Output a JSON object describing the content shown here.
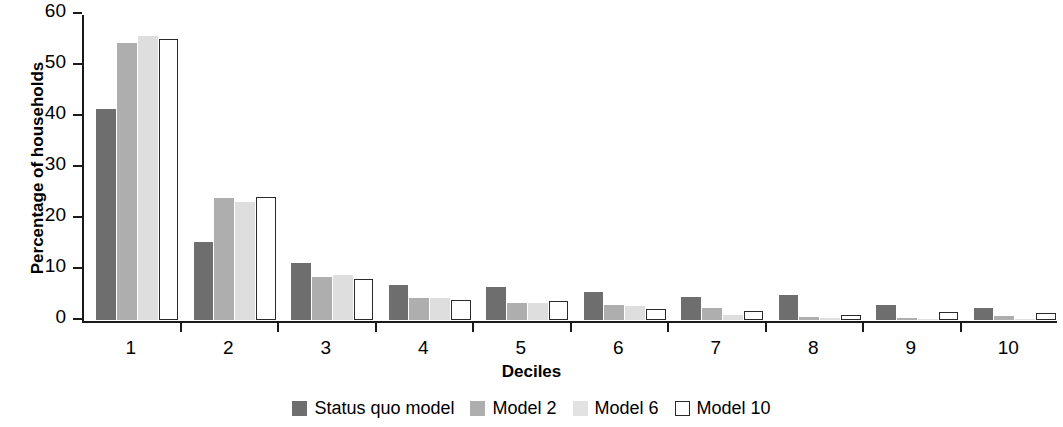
{
  "chart_data": {
    "type": "bar",
    "title": "",
    "xlabel": "Deciles",
    "ylabel": "Percentage of households",
    "categories": [
      "1",
      "2",
      "3",
      "4",
      "5",
      "6",
      "7",
      "8",
      "9",
      "10"
    ],
    "ylim": [
      0,
      60
    ],
    "yticks": [
      0,
      10,
      20,
      30,
      40,
      50,
      60
    ],
    "ytick_labels": [
      "0",
      "10",
      "20",
      "30",
      "40",
      "50",
      "60"
    ],
    "grid": false,
    "legend_position": "bottom-center",
    "series": [
      {
        "name": "Status quo model",
        "color": "#6e6e6e",
        "values": [
          41.4,
          15.3,
          11.1,
          6.8,
          6.5,
          5.4,
          4.6,
          4.9,
          3.0,
          2.4
        ]
      },
      {
        "name": "Model 2",
        "color": "#aeaeae",
        "values": [
          54.3,
          24.0,
          8.4,
          4.3,
          3.3,
          3.0,
          2.3,
          0.5,
          0.4,
          0.8
        ]
      },
      {
        "name": "Model 6",
        "color": "#dedede",
        "values": [
          55.7,
          23.2,
          8.8,
          4.3,
          3.4,
          2.8,
          1.0,
          0.3,
          0.2,
          0.2
        ]
      },
      {
        "name": "Model 10",
        "color": "#ffffff",
        "values": [
          55.1,
          24.2,
          8.0,
          3.9,
          3.8,
          2.2,
          1.7,
          0.9,
          1.6,
          1.3
        ]
      }
    ]
  }
}
